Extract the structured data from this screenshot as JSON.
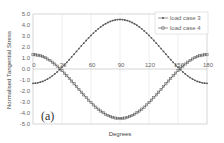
{
  "chart_data": {
    "type": "line",
    "title": "",
    "panel_label": "(a)",
    "xlabel": "Degrees",
    "ylabel": "Normalised Tangential Stress",
    "xlim": [
      0,
      180
    ],
    "ylim": [
      -5.0,
      5.0
    ],
    "xticks": [
      "0",
      "30",
      "60",
      "90",
      "120",
      "150",
      "180"
    ],
    "yticks": [
      "5.0",
      "4.0",
      "3.0",
      "2.0",
      "1.0",
      "0.0",
      "-1.0",
      "-2.0",
      "-3.0",
      "-4.0",
      "-5.0"
    ],
    "grid": {
      "vertical": true,
      "horizontal_zero_line": true
    },
    "legend_position": "upper right",
    "x": [
      0,
      15,
      30,
      35,
      45,
      60,
      75,
      90,
      105,
      120,
      135,
      145,
      150,
      165,
      180
    ],
    "series": [
      {
        "name": "load case 3",
        "marker": "diamond",
        "values": [
          -1.3,
          -0.9,
          -0.3,
          0.0,
          0.9,
          2.2,
          3.6,
          4.5,
          3.6,
          2.2,
          0.9,
          0.0,
          -0.3,
          -0.9,
          -1.3
        ]
      },
      {
        "name": "load case 4",
        "marker": "square",
        "values": [
          1.3,
          0.9,
          0.3,
          0.0,
          -0.9,
          -2.2,
          -3.6,
          -4.5,
          -3.6,
          -2.2,
          -0.9,
          0.0,
          0.3,
          0.9,
          1.3
        ]
      }
    ]
  },
  "legend": {
    "items": [
      "load case 3",
      "load case 4"
    ]
  }
}
